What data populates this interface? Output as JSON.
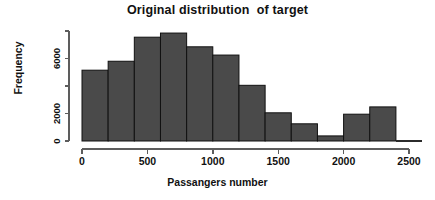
{
  "chart_data": {
    "type": "bar",
    "title": "Original distribution  of target",
    "xlabel": "Passangers number",
    "ylabel": "Frequency",
    "grid": false,
    "legend": false,
    "legend_position": "none",
    "bar_color": "#4a4a4a",
    "bar_edge_color": "#111111",
    "axis_color": "#5d5d5d",
    "bin_width": 200,
    "xlim": [
      0,
      2600
    ],
    "ylim": [
      0,
      8200
    ],
    "xticks": [
      0,
      500,
      1000,
      1500,
      2000,
      2500
    ],
    "xtick_labels": [
      "0",
      "500",
      "1000",
      "1500",
      "2000",
      "2500"
    ],
    "yticks": [
      0,
      2000,
      4000,
      6000,
      8000
    ],
    "ytick_labels": [
      "0",
      "2000",
      "",
      "6000",
      ""
    ],
    "ytick_labels_visible": [
      "0",
      "2000",
      "6000"
    ],
    "bin_edges": [
      0,
      200,
      400,
      600,
      800,
      1000,
      1200,
      1400,
      1600,
      1800,
      2000,
      2200,
      2400,
      2600
    ],
    "categories": [
      "0-200",
      "200-400",
      "400-600",
      "600-800",
      "800-1000",
      "1000-1200",
      "1200-1400",
      "1400-1600",
      "1600-1800",
      "1800-2000",
      "2000-2200",
      "2200-2400",
      "2400-2600"
    ],
    "values": [
      5150,
      5800,
      7550,
      7850,
      6850,
      6250,
      4050,
      2050,
      1250,
      370,
      1950,
      2480,
      0
    ]
  }
}
